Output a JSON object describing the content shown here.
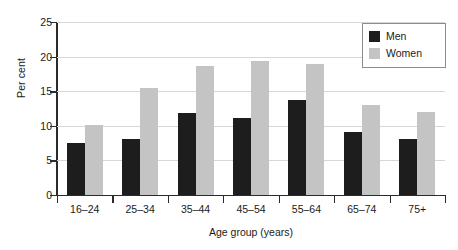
{
  "chart_data": {
    "type": "bar",
    "title": "",
    "xlabel": "Age group (years)",
    "ylabel": "Per cent",
    "categories": [
      "16–24",
      "25–34",
      "35–44",
      "45–54",
      "55–64",
      "65–74",
      "75+"
    ],
    "series": [
      {
        "name": "Men",
        "color": "#1d1d1d",
        "values": [
          7.5,
          8.1,
          11.8,
          11.2,
          13.7,
          9.1,
          8.1
        ]
      },
      {
        "name": "Women",
        "color": "#c4c4c4",
        "values": [
          10.1,
          15.4,
          18.6,
          19.4,
          19.0,
          13.0,
          12.0
        ]
      }
    ],
    "ylim": [
      0,
      25
    ],
    "yticks": [
      0,
      5,
      10,
      15,
      20,
      25
    ],
    "ytick_labels": [
      "0",
      "5",
      "10",
      "15",
      "20",
      "25"
    ],
    "grid": true,
    "legend_position": "top-right"
  },
  "legend": {
    "items": [
      {
        "label": "Men"
      },
      {
        "label": "Women"
      }
    ]
  }
}
